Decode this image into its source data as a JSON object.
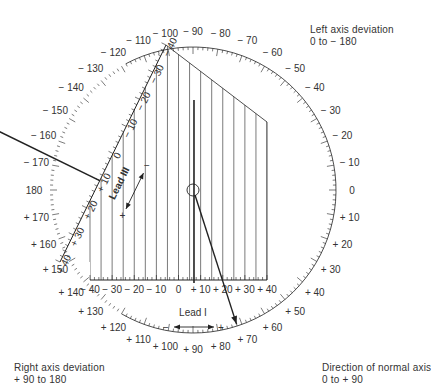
{
  "labels": {
    "left_axis": {
      "line1": "Left axis deviation",
      "line2": "0 to − 180"
    },
    "right_axis": {
      "line1": "Right axis deviation",
      "line2": "+ 90 to 180"
    },
    "normal_axis": {
      "line1": "Direction of normal axis",
      "line2": "0 to  + 90"
    }
  },
  "lead_i": {
    "name": "Lead I",
    "minus": "−",
    "plus": "+",
    "ticks": [
      "− 40",
      "− 30",
      "− 20",
      "− 10",
      "0",
      "+ 10",
      "+ 20",
      "+ 30",
      "+ 40"
    ]
  },
  "lead_iii": {
    "name": "Lead III",
    "minus": "−",
    "plus": "+",
    "ticks": [
      "+ 40",
      "+ 30",
      "+ 20",
      "+ 10",
      "0",
      "− 10",
      "− 20",
      "− 30",
      "− 40"
    ]
  },
  "dial": {
    "labels": [
      {
        "deg": 0,
        "text": "0"
      },
      {
        "deg": 10,
        "text": "+ 10"
      },
      {
        "deg": 20,
        "text": "+ 20"
      },
      {
        "deg": 30,
        "text": "+ 30"
      },
      {
        "deg": 40,
        "text": "+ 40"
      },
      {
        "deg": 50,
        "text": "+ 50"
      },
      {
        "deg": 60,
        "text": "+ 60"
      },
      {
        "deg": 70,
        "text": "+ 70"
      },
      {
        "deg": 80,
        "text": "+ 80"
      },
      {
        "deg": 90,
        "text": "+ 90"
      },
      {
        "deg": 100,
        "text": "+ 100"
      },
      {
        "deg": 110,
        "text": "+ 110"
      },
      {
        "deg": 120,
        "text": "+ 120"
      },
      {
        "deg": 130,
        "text": "+ 130"
      },
      {
        "deg": 140,
        "text": "+ 140"
      },
      {
        "deg": 150,
        "text": "+ 150"
      },
      {
        "deg": 160,
        "text": "+ 160"
      },
      {
        "deg": 170,
        "text": "+ 170"
      },
      {
        "deg": 180,
        "text": "180"
      },
      {
        "deg": -170,
        "text": "− 170"
      },
      {
        "deg": -160,
        "text": "− 160"
      },
      {
        "deg": -150,
        "text": "− 150"
      },
      {
        "deg": -140,
        "text": "− 140"
      },
      {
        "deg": -130,
        "text": "− 130"
      },
      {
        "deg": -120,
        "text": "− 120"
      },
      {
        "deg": -110,
        "text": "− 110"
      },
      {
        "deg": -100,
        "text": "− 100"
      },
      {
        "deg": -90,
        "text": "− 90"
      },
      {
        "deg": -80,
        "text": "− 80"
      },
      {
        "deg": -70,
        "text": "− 70"
      },
      {
        "deg": -60,
        "text": "− 60"
      },
      {
        "deg": -50,
        "text": "− 50"
      },
      {
        "deg": -40,
        "text": "− 40"
      },
      {
        "deg": -30,
        "text": "− 30"
      },
      {
        "deg": -20,
        "text": "− 20"
      },
      {
        "deg": -10,
        "text": "− 10"
      }
    ]
  },
  "plotted": {
    "lead_i_value": 7,
    "lead_iii_value": 10,
    "resulting_axis_deg": 72
  },
  "colors": {
    "ink": "#222222",
    "text": "#333333",
    "background": "#ffffff"
  }
}
